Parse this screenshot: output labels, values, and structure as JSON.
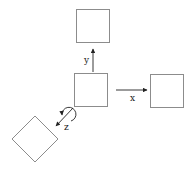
{
  "diagram": {
    "title": "",
    "colors": {
      "box_stroke": "#8c8c8c",
      "arrow": "#222222",
      "background": "#ffffff"
    },
    "nodes": [
      {
        "id": "center",
        "shape": "square",
        "x": 74,
        "y": 73,
        "size": 33
      },
      {
        "id": "top",
        "shape": "square",
        "x": 76,
        "y": 9,
        "size": 33
      },
      {
        "id": "right",
        "shape": "square",
        "x": 150,
        "y": 74,
        "size": 33
      },
      {
        "id": "bottom-left",
        "shape": "diamond",
        "cx": 35,
        "cy": 139,
        "half_diagonal": 23
      }
    ],
    "edges": [
      {
        "from": "center",
        "to": "top",
        "label": "y",
        "type": "translation"
      },
      {
        "from": "center",
        "to": "right",
        "label": "x",
        "type": "translation"
      },
      {
        "from": "center",
        "to": "bottom-left",
        "label": "z",
        "type": "rotation"
      }
    ],
    "labels": {
      "x": "x",
      "y": "y",
      "z": "z"
    }
  }
}
